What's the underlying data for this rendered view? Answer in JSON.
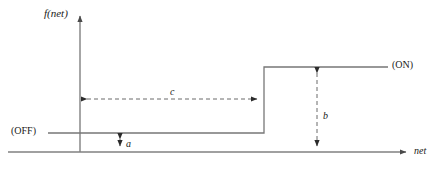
{
  "figure": {
    "background_color": "#ffffff",
    "line_color": "#595959",
    "dashed_color": "#666666",
    "text_color": "#1a1a1a"
  },
  "axes": {
    "y_axis": {
      "label": "f(net)",
      "x": 80,
      "top": 14,
      "bottom": 152
    },
    "x_axis": {
      "label": "net",
      "y": 152,
      "left": 8,
      "right": 410
    }
  },
  "curve": {
    "name": "step-function",
    "off_level_y": 133,
    "on_level_y": 67,
    "step_x": 264,
    "off_segment": {
      "x_start": 48,
      "x_end": 264
    },
    "on_segment": {
      "x_start": 264,
      "x_end": 388
    }
  },
  "state_labels": {
    "off": "(OFF)",
    "on": "(ON)"
  },
  "annotations": [
    {
      "id": "a",
      "label": "a",
      "orientation": "vertical",
      "x": 120,
      "y_start": 133,
      "y_end": 152,
      "style": "dashed-double-arrow",
      "meaning": "offset of OFF level above the net axis"
    },
    {
      "id": "b",
      "label": "b",
      "orientation": "vertical",
      "x": 317,
      "y_start": 67,
      "y_end": 152,
      "style": "dashed-double-arrow",
      "meaning": "height of the ON level above the net axis"
    },
    {
      "id": "c",
      "label": "c",
      "orientation": "horizontal",
      "y": 99,
      "x_start": 80,
      "x_end": 264,
      "style": "dashed-double-arrow",
      "meaning": "net value at which the function switches from OFF to ON"
    }
  ]
}
